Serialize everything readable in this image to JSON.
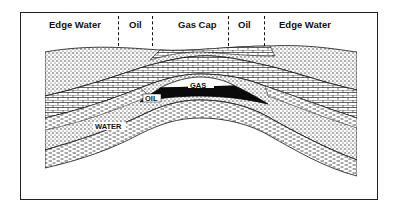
{
  "diagram": {
    "zone_labels": [
      {
        "id": "edge-water-left",
        "text": "Edge Water"
      },
      {
        "id": "oil-left",
        "text": "Oil"
      },
      {
        "id": "gas-cap",
        "text": "Gas Cap"
      },
      {
        "id": "oil-right",
        "text": "Oil"
      },
      {
        "id": "edge-water-right",
        "text": "Edge Water"
      }
    ],
    "reservoir_labels": {
      "gas": "GAS",
      "oil": "OIL",
      "water": "WATER"
    },
    "colors": {
      "ink": "#111111",
      "background": "#ffffff",
      "oil_fill": "#0a0a0a"
    }
  }
}
